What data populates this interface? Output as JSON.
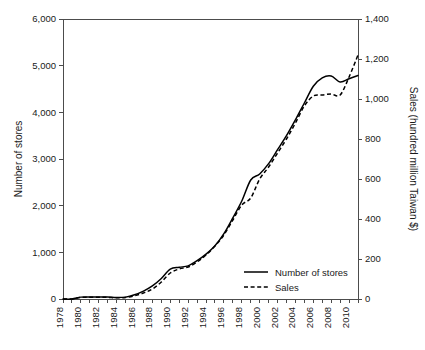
{
  "chart_data": {
    "type": "line",
    "title": "",
    "xlabel": "",
    "grid": false,
    "legend_position": "inside-bottom-right",
    "x": [
      1978,
      1979,
      1980,
      1981,
      1982,
      1983,
      1984,
      1985,
      1986,
      1987,
      1988,
      1989,
      1990,
      1991,
      1992,
      1993,
      1994,
      1995,
      1996,
      1997,
      1998,
      1999,
      2000,
      2001,
      2002,
      2003,
      2004,
      2005,
      2006,
      2007,
      2008,
      2009,
      2010,
      2011
    ],
    "xlim": [
      1978,
      2011
    ],
    "xticks": [
      1978,
      1979,
      1980,
      1981,
      1982,
      1983,
      1984,
      1985,
      1986,
      1987,
      1988,
      1989,
      1990,
      1991,
      1992,
      1993,
      1994,
      1995,
      1996,
      1997,
      1998,
      1999,
      2000,
      2001,
      2002,
      2003,
      2004,
      2005,
      2006,
      2007,
      2008,
      2009,
      2010,
      2011
    ],
    "xtick_labels": [
      "1978",
      "",
      "1980",
      "",
      "1982",
      "",
      "1984",
      "",
      "1986",
      "",
      "1988",
      "",
      "1990",
      "",
      "1992",
      "",
      "1994",
      "",
      "1996",
      "",
      "1998",
      "",
      "2000",
      "",
      "2002",
      "",
      "2004",
      "",
      "2006",
      "",
      "2008",
      "",
      "2010",
      ""
    ],
    "left_axis": {
      "label": "Number of stores",
      "ylim": [
        0,
        6000
      ],
      "ticks": [
        0,
        1000,
        2000,
        3000,
        4000,
        5000,
        6000
      ],
      "tick_labels": [
        "0",
        "1,000",
        "2,000",
        "3,000",
        "4,000",
        "5,000",
        "6,000"
      ]
    },
    "right_axis": {
      "label": "Sales (hundred million Taiwan $)",
      "ylim": [
        0,
        1400
      ],
      "ticks": [
        0,
        200,
        400,
        600,
        800,
        1000,
        1200,
        1400
      ],
      "tick_labels": [
        "0",
        "200",
        "400",
        "600",
        "800",
        "1,000",
        "1,200",
        "1,400"
      ]
    },
    "series": [
      {
        "name": "Number of stores",
        "axis": "left",
        "style": "solid",
        "color": "#000000",
        "values": [
          0,
          0,
          40,
          45,
          45,
          42,
          30,
          40,
          90,
          170,
          280,
          440,
          640,
          680,
          710,
          820,
          960,
          1140,
          1400,
          1740,
          2100,
          2550,
          2680,
          2900,
          3200,
          3500,
          3840,
          4200,
          4560,
          4740,
          4780,
          4650,
          4720,
          4790
        ]
      },
      {
        "name": "Sales",
        "axis": "right",
        "style": "dashed",
        "color": "#000000",
        "values": [
          0,
          0,
          8,
          9,
          9,
          8,
          6,
          8,
          16,
          30,
          50,
          85,
          130,
          150,
          160,
          185,
          220,
          265,
          320,
          395,
          470,
          505,
          600,
          660,
          730,
          800,
          880,
          965,
          1015,
          1020,
          1025,
          1020,
          1110,
          1220
        ]
      }
    ],
    "legend": [
      {
        "label": "Number of stores",
        "style": "solid"
      },
      {
        "label": "Sales",
        "style": "dashed"
      }
    ]
  }
}
